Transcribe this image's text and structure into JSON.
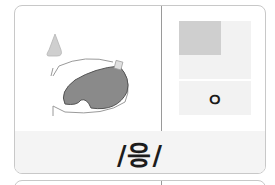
{
  "card": {
    "phoneme": "/응/",
    "jamo": "ㅇ",
    "diagram": {
      "description": "mouth and tongue articulation diagram with airflow arrows",
      "icons": [
        "nose-icon",
        "tongue-icon",
        "airflow-arrow-icon"
      ]
    },
    "colors": {
      "highlight_cell": "#cfcfcf",
      "light_cell": "#f2f2f2",
      "band": "#f4f4f4",
      "border": "#c8c8c8",
      "tongue": "#8a8a8a"
    }
  }
}
